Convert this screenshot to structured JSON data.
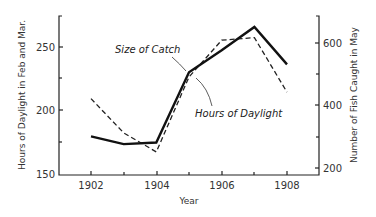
{
  "chart_data": {
    "type": "line",
    "title": "",
    "xlabel": "Year",
    "ylabel_left": "Hours of Daylight in Feb and Mar.",
    "ylabel_right": "Number of Fish Caught in May",
    "x": [
      1902,
      1903,
      1904,
      1905,
      1906,
      1907,
      1908
    ],
    "x_ticks": [
      "1902",
      "1904",
      "1906",
      "1908"
    ],
    "y_left_ticks": [
      "150",
      "200",
      "250"
    ],
    "y_right_ticks": [
      "200",
      "400",
      "600"
    ],
    "ylim_left": [
      150,
      275
    ],
    "ylim_right": [
      180,
      700
    ],
    "grid": false,
    "legend": "none (inline annotations)",
    "series": [
      {
        "name": "Size of Catch",
        "axis": "right",
        "style": "solid",
        "values": [
          300,
          275,
          280,
          505,
          575,
          650,
          530
        ]
      },
      {
        "name": "Hours of Daylight",
        "axis": "left",
        "style": "dashed",
        "values": [
          209,
          182,
          167,
          226,
          255,
          257,
          214
        ]
      }
    ],
    "annotations": [
      "Size of Catch",
      "Hours of Daylight"
    ]
  }
}
